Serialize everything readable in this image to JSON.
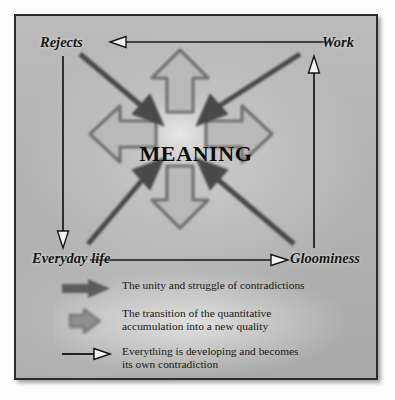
{
  "diagram": {
    "center": {
      "label": "MEANING"
    },
    "corners": [
      {
        "id": "rejects",
        "label": "Rejects",
        "position": "top-left"
      },
      {
        "id": "work",
        "label": "Work",
        "position": "top-right"
      },
      {
        "id": "everyday",
        "label": "Everyday life",
        "position": "bottom-left"
      },
      {
        "id": "gloominess",
        "label": "Gloominess",
        "position": "bottom-right"
      }
    ],
    "edges": [
      {
        "from": "Work",
        "to": "Rejects",
        "style": "thin-hollow-arrow",
        "direction": "left"
      },
      {
        "from": "Everyday life",
        "to": "Gloominess",
        "style": "thin-hollow-arrow",
        "direction": "right"
      },
      {
        "from": "Rejects",
        "to": "Everyday life",
        "style": "thin-hollow-arrow",
        "direction": "down"
      },
      {
        "from": "Gloominess",
        "to": "Work",
        "style": "thin-hollow-arrow",
        "direction": "up"
      }
    ],
    "inward_arrows": {
      "count": 4,
      "style": "solid-dark-diagonal",
      "from": [
        "Rejects",
        "Work",
        "Everyday life",
        "Gloominess"
      ],
      "to": "MEANING"
    },
    "outward_arrows": {
      "count": 4,
      "style": "hollow-gray-block",
      "directions": [
        "up",
        "right",
        "down",
        "left"
      ]
    }
  },
  "legend": {
    "items": [
      {
        "icon": "solid-thick-arrow-icon",
        "text": "The unity and struggle of contradictions"
      },
      {
        "icon": "hollow-block-arrow-icon",
        "text": "The transition of the quantitative\naccumulation into a new quality"
      },
      {
        "icon": "thin-line-arrow-icon",
        "text": "Everything is developing and becomes\nits own contradiction"
      }
    ]
  },
  "colors": {
    "plate_background": "#b6b6b6",
    "plate_border": "#2b2b2b",
    "dark_arrow": "#4a4a4a",
    "light_arrow_fill": "#b9b9b9",
    "light_arrow_stroke": "#6e6e6e",
    "text": "#15130f"
  }
}
